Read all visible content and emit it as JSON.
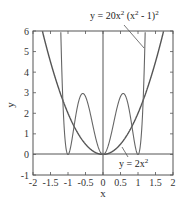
{
  "chart_data": {
    "type": "line",
    "title": "",
    "xlabel": "x",
    "ylabel": "y",
    "xlim": [
      -2,
      2
    ],
    "ylim": [
      -1,
      6
    ],
    "grid": false,
    "x_ticks": [
      "-2",
      "-1.5",
      "-1",
      "-0.5",
      "0",
      "0.5",
      "1",
      "1.5",
      "2"
    ],
    "y_ticks": [
      "-1",
      "0",
      "1",
      "2",
      "3",
      "4",
      "5",
      "6"
    ],
    "series": [
      {
        "name": "y = 2x²",
        "formula": "2*x^2",
        "x": [
          -1.732,
          -1.5,
          -1.0,
          -0.5,
          0,
          0.5,
          1.0,
          1.5,
          1.732
        ],
        "values": [
          6.0,
          4.5,
          2.0,
          0.5,
          0,
          0.5,
          2.0,
          4.5,
          6.0
        ]
      },
      {
        "name": "y = 20x² (x² - 1)²",
        "formula": "20*x^2*(x^2-1)^2",
        "x": [
          -1.14,
          -1.0,
          -0.577,
          0,
          0.577,
          1.0,
          1.14
        ],
        "values": [
          6.0,
          0,
          2.96,
          0,
          2.96,
          0,
          6.0
        ]
      }
    ],
    "annotations": [
      {
        "text_main": "y = 20x",
        "sup1": "2",
        "text_mid": " (x",
        "sup2": "2",
        "text_end": " - 1)",
        "sup3": "2"
      },
      {
        "text_main": "y = 2x",
        "sup1": "2"
      }
    ]
  }
}
